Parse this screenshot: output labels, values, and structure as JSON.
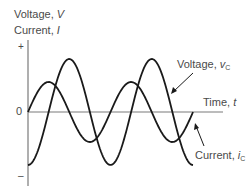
{
  "axes": {
    "y_label_line1": "Voltage, ",
    "y_label_line1_var": "V",
    "y_label_line2": "Current, ",
    "y_label_line2_var": "I",
    "y_plus": "+",
    "y_zero": "0",
    "y_minus": "–",
    "x_label": "Time, ",
    "x_label_var": "t"
  },
  "curves": {
    "voltage": {
      "label": "Voltage, ",
      "var": "v",
      "sub": "C"
    },
    "current": {
      "label": "Current, ",
      "var": "i",
      "sub": "C"
    }
  },
  "colors": {
    "curve": "#1a1a1a",
    "axis": "#7a7a7a",
    "text": "#4a4a4a"
  }
}
